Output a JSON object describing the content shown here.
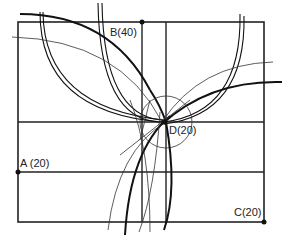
{
  "diagram": {
    "type": "geometric-construction",
    "points": [
      {
        "id": "A",
        "label": "A (20)",
        "x": 18,
        "y": 172
      },
      {
        "id": "B",
        "label": "B(40)",
        "x": 142,
        "y": 22
      },
      {
        "id": "C",
        "label": "C(20)",
        "x": 264,
        "y": 222
      },
      {
        "id": "D",
        "label": "D(20)",
        "x": 164,
        "y": 122
      }
    ],
    "colors": {
      "line": "#222222",
      "background": "#ffffff"
    }
  }
}
